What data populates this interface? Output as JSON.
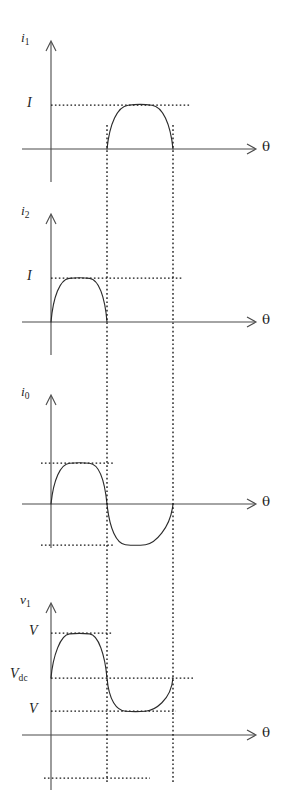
{
  "figure": {
    "background_color": "#ffffff",
    "axis_color": "#4a4a4a",
    "curve_color": "#2b2b2b",
    "guide_color": "#141414",
    "theta_symbol": "θ",
    "commutation_guides_x": [
      107,
      173
    ],
    "origin_x": 51,
    "axis_end_x": 255
  },
  "panels": [
    {
      "id": "i1",
      "y_axis_symbol": "i",
      "y_axis_subscript": "1",
      "x_axis_label": "θ",
      "baseline_y": 149,
      "axis_top_y": 42,
      "axis_bottom_y": 182,
      "levels": [
        {
          "label": "I",
          "subscript": "",
          "y": 105,
          "x_start": 51,
          "x_end": 190
        }
      ],
      "curve": {
        "type": "half-sine-positive",
        "start_x": 107,
        "end_x": 173,
        "peak_y": 105,
        "description": "Positive half sine pulse between the two commutation guides, peak at level I"
      }
    },
    {
      "id": "i2",
      "y_axis_symbol": "i",
      "y_axis_subscript": "2",
      "x_axis_label": "θ",
      "baseline_y": 322,
      "axis_top_y": 215,
      "axis_bottom_y": 355,
      "levels": [
        {
          "label": "I",
          "subscript": "",
          "y": 278,
          "x_start": 51,
          "x_end": 183
        }
      ],
      "curve": {
        "type": "half-sine-positive",
        "start_x": 51,
        "end_x": 107,
        "peak_y": 278,
        "description": "Positive half sine pulse from the origin to the first commutation guide, peak at level I"
      }
    },
    {
      "id": "i0",
      "y_axis_symbol": "i",
      "y_axis_subscript": "0",
      "x_axis_label": "θ",
      "baseline_y": 504,
      "axis_top_y": 396,
      "axis_bottom_y": 548,
      "levels": [
        {
          "label": "",
          "subscript": "",
          "y": 463,
          "x_start": 41,
          "x_end": 113
        },
        {
          "label": "",
          "subscript": "",
          "y": 545,
          "x_start": 41,
          "x_end": 113
        }
      ],
      "curve": {
        "type": "full-sine",
        "start_x": 51,
        "zero_crossing_x": 107,
        "end_x": 173,
        "peak_y": 463,
        "trough_y": 545,
        "description": "One full sine cycle: positive lobe from origin to first guide, negative lobe to second guide"
      }
    },
    {
      "id": "v1",
      "y_axis_symbol": "ν",
      "y_axis_subscript": "1",
      "x_axis_label": "θ",
      "baseline_y": 735,
      "axis_top_y": 604,
      "axis_bottom_y": 790,
      "levels": [
        {
          "label": "V",
          "subscript": "",
          "y": 633,
          "x_start": 51,
          "x_end": 113
        },
        {
          "label": "V",
          "subscript": "dc",
          "y": 678,
          "x_start": 51,
          "x_end": 193
        },
        {
          "label": "V",
          "subscript": "",
          "y": 711,
          "x_start": 51,
          "x_end": 176
        },
        {
          "label": "",
          "subscript": "",
          "y": 778,
          "x_start": 44,
          "x_end": 150
        }
      ],
      "curve": {
        "type": "full-sine-offset",
        "start_x": 51,
        "zero_crossing_x": 107,
        "end_x": 173,
        "mean_y": 678,
        "peak_y": 633,
        "trough_y": 711,
        "description": "Sine oscillating about the V_dc level, peak at upper V, trough at lower V"
      }
    }
  ],
  "labels": {
    "level_I": "I",
    "level_V": "V",
    "level_Vdc_base": "V",
    "level_Vdc_sub": "dc",
    "theta": "θ"
  }
}
